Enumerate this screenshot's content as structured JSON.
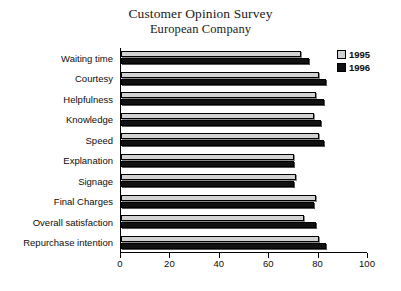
{
  "chart_data": {
    "type": "bar",
    "orientation": "horizontal",
    "title": "Customer Opinion Survey",
    "subtitle": "European Company",
    "xlabel": "",
    "ylabel": "",
    "xlim": [
      0,
      100
    ],
    "xticks": [
      0,
      20,
      40,
      60,
      80,
      100
    ],
    "grid": false,
    "legend_position": "top-right",
    "categories": [
      "Waiting time",
      "Courtesy",
      "Helpfulness",
      "Knowledge",
      "Speed",
      "Explanation",
      "Signage",
      "Final Charges",
      "Overall satisfaction",
      "Repurchase intention"
    ],
    "series": [
      {
        "name": "1995",
        "color": "#d2d2d2",
        "values": [
          73,
          80,
          79,
          78,
          80,
          70,
          71,
          79,
          74,
          80
        ]
      },
      {
        "name": "1996",
        "color": "#111111",
        "values": [
          76,
          83,
          82,
          81,
          82,
          70,
          70,
          78,
          79,
          83
        ]
      }
    ]
  }
}
